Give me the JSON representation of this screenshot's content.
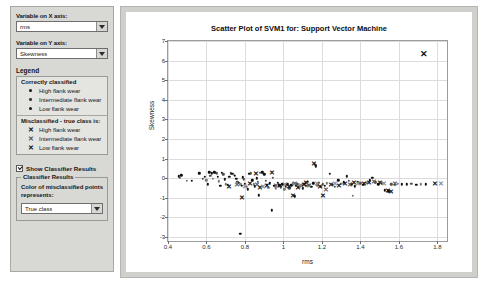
{
  "panel": {
    "x_axis": {
      "label": "Variable on X axis:",
      "value": "rms",
      "options": [
        "rms",
        "mean",
        "kurtosis",
        "Skewness"
      ]
    },
    "y_axis": {
      "label": "Variable on Y axis:",
      "value": "Skewness",
      "options": [
        "rms",
        "mean",
        "kurtosis",
        "Skewness"
      ]
    },
    "legend": {
      "title": "Legend",
      "correct_heading": "Correctly classified",
      "correct_items": [
        {
          "marker": "dot-lg",
          "label": "High flank wear"
        },
        {
          "marker": "dot-md",
          "label": "Intermediate flank wear"
        },
        {
          "marker": "dot-sm",
          "label": "Low flank wear"
        }
      ],
      "misclassified_heading": "Misclassified - true class is:",
      "misclassified_items": [
        {
          "marker": "x-lg",
          "label": "High flank wear"
        },
        {
          "marker": "x-md",
          "label": "Intermediate flank wear"
        },
        {
          "marker": "x-sm",
          "label": "Low flank wear"
        }
      ]
    },
    "show_classifier_results": {
      "label": "Show Classifier Results",
      "checked": true
    },
    "classifier_results": {
      "group_title": "Classifier Results",
      "description": "Color of misclassified points represents:",
      "value": "True class",
      "options": [
        "True class",
        "Predicted class"
      ]
    }
  },
  "chart_data": {
    "type": "scatter",
    "title": "Scatter Plot of SVM1 for: Support Vector Machine",
    "xlabel": "rms",
    "ylabel": "Skewness",
    "xlim": [
      0.4,
      1.85
    ],
    "ylim": [
      -3.2,
      7.0
    ],
    "xticks": [
      0.4,
      0.6,
      0.8,
      1.0,
      1.2,
      1.4,
      1.6,
      1.8
    ],
    "xticklabels": [
      "0.4",
      "0.6",
      "0.8",
      "1",
      "1.2",
      "1.4",
      "1.6",
      "1.8"
    ],
    "yticks": [
      -3,
      -2,
      -1,
      0,
      1,
      2,
      3,
      4,
      5,
      6,
      7
    ],
    "yticklabels": [
      "-3",
      "-2",
      "-1",
      "0",
      "1",
      "2",
      "3",
      "4",
      "5",
      "6",
      "7"
    ],
    "grid": true,
    "legend_position": "external-panel",
    "series": [
      {
        "name": "Correctly classified",
        "marker": "dot",
        "points": [
          [
            0.455,
            0.1
          ],
          [
            0.462,
            0.02
          ],
          [
            0.47,
            0.16
          ],
          [
            0.497,
            -0.12
          ],
          [
            0.523,
            -0.14
          ],
          [
            0.563,
            0.25
          ],
          [
            0.58,
            -0.04
          ],
          [
            0.592,
            0.06
          ],
          [
            0.6,
            -0.1
          ],
          [
            0.607,
            -0.3
          ],
          [
            0.615,
            0.3
          ],
          [
            0.62,
            0.12
          ],
          [
            0.628,
            0.26
          ],
          [
            0.632,
            -0.02
          ],
          [
            0.64,
            0.3
          ],
          [
            0.648,
            0.28
          ],
          [
            0.655,
            0.26
          ],
          [
            0.66,
            0.06
          ],
          [
            0.665,
            -0.16
          ],
          [
            0.672,
            -0.38
          ],
          [
            0.68,
            0.27
          ],
          [
            0.688,
            0.2
          ],
          [
            0.695,
            -0.05
          ],
          [
            0.7,
            -0.3
          ],
          [
            0.712,
            -0.34
          ],
          [
            0.718,
            0.08
          ],
          [
            0.725,
            0.25
          ],
          [
            0.735,
            0.22
          ],
          [
            0.742,
            0.18
          ],
          [
            0.748,
            0.12
          ],
          [
            0.755,
            -0.02
          ],
          [
            0.76,
            -0.18
          ],
          [
            0.768,
            -0.22
          ],
          [
            0.775,
            -0.3
          ],
          [
            0.782,
            -0.4
          ],
          [
            0.788,
            0.05
          ],
          [
            0.795,
            -0.06
          ],
          [
            0.8,
            -0.28
          ],
          [
            0.808,
            -0.45
          ],
          [
            0.815,
            -0.56
          ],
          [
            0.822,
            0.22
          ],
          [
            0.83,
            0.26
          ],
          [
            0.838,
            -0.1
          ],
          [
            0.845,
            -0.3
          ],
          [
            0.852,
            -0.42
          ],
          [
            0.86,
            0.0
          ],
          [
            0.868,
            -0.18
          ],
          [
            0.872,
            -0.86
          ],
          [
            0.88,
            0.28
          ],
          [
            0.89,
            0.3
          ],
          [
            0.9,
            0.2
          ],
          [
            0.908,
            -0.12
          ],
          [
            0.915,
            -0.34
          ],
          [
            0.922,
            -0.5
          ],
          [
            0.93,
            -0.25
          ],
          [
            0.938,
            -1.64
          ],
          [
            0.945,
            0.02
          ],
          [
            0.952,
            -0.4
          ],
          [
            0.96,
            -0.52
          ],
          [
            0.97,
            -0.22
          ],
          [
            0.978,
            -0.36
          ],
          [
            0.985,
            -0.46
          ],
          [
            0.995,
            -0.3
          ],
          [
            1.005,
            -0.56
          ],
          [
            1.012,
            -0.42
          ],
          [
            1.02,
            -0.3
          ],
          [
            1.03,
            -0.52
          ],
          [
            1.04,
            -0.36
          ],
          [
            1.048,
            -0.25
          ],
          [
            1.058,
            -0.92
          ],
          [
            1.065,
            -0.4
          ],
          [
            1.072,
            -0.3
          ],
          [
            1.082,
            -0.45
          ],
          [
            1.092,
            -0.36
          ],
          [
            1.1,
            -0.52
          ],
          [
            1.108,
            -0.28
          ],
          [
            1.118,
            -0.4
          ],
          [
            1.125,
            -0.18
          ],
          [
            1.135,
            -0.32
          ],
          [
            1.145,
            -0.44
          ],
          [
            1.155,
            -0.26
          ],
          [
            1.165,
            0.7
          ],
          [
            1.168,
            0.6
          ],
          [
            1.175,
            -0.36
          ],
          [
            1.185,
            -0.22
          ],
          [
            1.195,
            -0.45
          ],
          [
            1.205,
            -0.3
          ],
          [
            1.215,
            -0.4
          ],
          [
            1.225,
            -0.25
          ],
          [
            1.24,
            0.22
          ],
          [
            1.255,
            -0.32
          ],
          [
            1.268,
            -0.44
          ],
          [
            1.285,
            -0.1
          ],
          [
            1.3,
            -0.28
          ],
          [
            1.315,
            -0.2
          ],
          [
            1.33,
            0.1
          ],
          [
            1.34,
            -0.12
          ],
          [
            1.352,
            -0.3
          ],
          [
            1.36,
            -0.9
          ],
          [
            1.37,
            -0.42
          ],
          [
            1.385,
            -0.18
          ],
          [
            1.4,
            -0.26
          ],
          [
            1.415,
            -0.34
          ],
          [
            1.43,
            -0.22
          ],
          [
            1.448,
            -0.1
          ],
          [
            1.462,
            0.02
          ],
          [
            1.478,
            -0.2
          ],
          [
            1.492,
            -0.3
          ],
          [
            1.51,
            -0.26
          ],
          [
            1.528,
            -0.62
          ],
          [
            1.545,
            -0.66
          ],
          [
            1.56,
            -0.3
          ],
          [
            1.578,
            -0.34
          ],
          [
            1.595,
            -0.28
          ],
          [
            1.615,
            -0.3
          ],
          [
            1.64,
            -0.3
          ],
          [
            1.665,
            -0.28
          ],
          [
            1.69,
            -0.32
          ],
          [
            1.715,
            -0.3
          ],
          [
            1.74,
            -0.3
          ],
          [
            0.775,
            -2.82
          ]
        ]
      },
      {
        "name": "Misclassified",
        "marker": "x",
        "points": [
          [
            0.718,
            -0.44
          ],
          [
            0.76,
            -0.34
          ],
          [
            0.782,
            -1.02
          ],
          [
            0.8,
            -0.44
          ],
          [
            0.825,
            -0.3
          ],
          [
            0.855,
            0.2
          ],
          [
            0.862,
            -0.34
          ],
          [
            0.88,
            -0.5
          ],
          [
            0.895,
            -0.45
          ],
          [
            0.912,
            -0.4
          ],
          [
            0.938,
            0.26
          ],
          [
            0.96,
            -0.4
          ],
          [
            0.98,
            -0.38
          ],
          [
            1.01,
            -0.35
          ],
          [
            1.028,
            -0.46
          ],
          [
            1.048,
            -0.92
          ],
          [
            1.06,
            -0.3
          ],
          [
            1.075,
            -0.52
          ],
          [
            1.09,
            -0.4
          ],
          [
            1.105,
            -0.34
          ],
          [
            1.118,
            -0.26
          ],
          [
            1.135,
            -0.42
          ],
          [
            1.158,
            0.72
          ],
          [
            1.172,
            -0.3
          ],
          [
            1.19,
            -0.44
          ],
          [
            1.205,
            -0.9
          ],
          [
            1.222,
            -0.62
          ],
          [
            1.245,
            -0.36
          ],
          [
            1.268,
            -0.3
          ],
          [
            1.29,
            -0.38
          ],
          [
            1.32,
            -0.28
          ],
          [
            1.345,
            -0.32
          ],
          [
            1.368,
            -0.24
          ],
          [
            1.39,
            -0.3
          ],
          [
            1.418,
            -0.28
          ],
          [
            1.445,
            -0.24
          ],
          [
            1.47,
            -0.2
          ],
          [
            1.5,
            -0.26
          ],
          [
            1.522,
            -0.28
          ],
          [
            1.545,
            -0.66
          ],
          [
            1.558,
            -0.68
          ],
          [
            1.582,
            -0.3
          ],
          [
            1.79,
            -0.3
          ],
          [
            1.818,
            -0.3
          ],
          [
            1.732,
            6.32
          ]
        ]
      }
    ]
  }
}
